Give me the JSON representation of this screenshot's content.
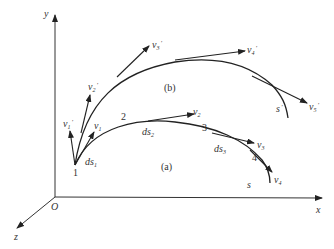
{
  "diagram": {
    "axes": {
      "x_label": "x",
      "y_label": "y",
      "z_label": "z",
      "origin_label": "O"
    },
    "curve_a": {
      "caption": "(a)",
      "end_label": "s",
      "points": [
        "1",
        "2",
        "3",
        "4"
      ],
      "segments": [
        {
          "base": "ds",
          "sub": "1"
        },
        {
          "base": "ds",
          "sub": "2"
        },
        {
          "base": "ds",
          "sub": "3"
        }
      ],
      "velocities": [
        {
          "base": "v",
          "sub": "1"
        },
        {
          "base": "v",
          "sub": "2"
        },
        {
          "base": "v",
          "sub": "3"
        },
        {
          "base": "v",
          "sub": "4"
        }
      ]
    },
    "curve_b": {
      "caption": "(b)",
      "end_label": "s",
      "end_prime": "'",
      "velocities": [
        {
          "base": "v",
          "sub": "1",
          "prime": "'"
        },
        {
          "base": "v",
          "sub": "2",
          "prime": "'"
        },
        {
          "base": "v",
          "sub": "3",
          "prime": "'"
        },
        {
          "base": "v",
          "sub": "4",
          "prime": "'"
        },
        {
          "base": "v",
          "sub": "5",
          "prime": "'"
        }
      ]
    },
    "colors": {
      "stroke": "#222222",
      "text": "#333333"
    }
  }
}
